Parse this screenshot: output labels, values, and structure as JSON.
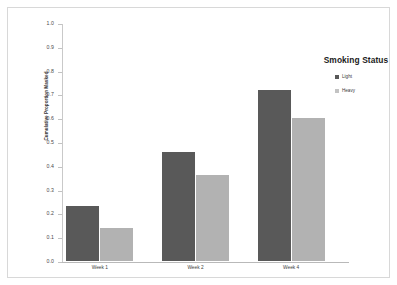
{
  "chart_data": {
    "type": "bar",
    "title": "",
    "xlabel": "",
    "ylabel": "Cumulative Proportion Masked",
    "categories": [
      "Week 1",
      "Week 2",
      "Week 4"
    ],
    "series": [
      {
        "name": "Light",
        "color": "#595959",
        "values": [
          0.23,
          0.46,
          0.72
        ]
      },
      {
        "name": "Heavy",
        "color": "#b2b2b2",
        "values": [
          0.14,
          0.36,
          0.6
        ]
      }
    ],
    "ylim": [
      0.0,
      1.0
    ],
    "yticks": [
      "0.0",
      "0.1",
      "0.2",
      "0.3",
      "0.4",
      "0.5",
      "0.6",
      "0.7",
      "0.8",
      "0.9",
      "1.0"
    ],
    "grid": false,
    "legend": {
      "title": "Smoking Status",
      "position": "right",
      "entries": [
        "Light",
        "Heavy"
      ]
    }
  }
}
